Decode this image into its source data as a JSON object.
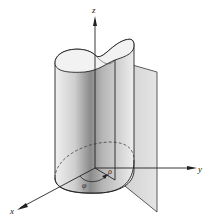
{
  "figure": {
    "axes": {
      "x_label": "x",
      "y_label": "y",
      "z_label": "z"
    },
    "annotations": {
      "rho_label": "ρ",
      "phi_label": "φ"
    },
    "colors": {
      "line": "#222222",
      "surface_light": "#e6e6e6",
      "surface_dark": "#8c8c8c",
      "plane": "#d9d9d9",
      "background": "#ffffff"
    }
  }
}
